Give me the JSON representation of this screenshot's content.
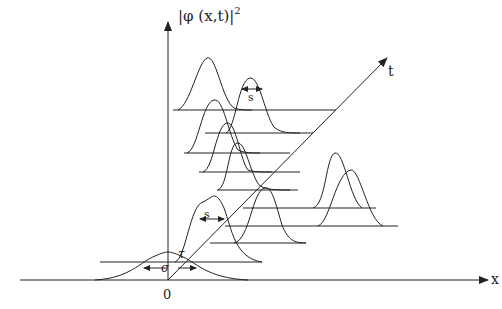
{
  "diagram": {
    "labels": {
      "y_axis": "|φ (x,t)|",
      "y_axis_exponent": "2",
      "t_axis": "t",
      "x_axis": "x",
      "origin": "0",
      "sigma": "σ",
      "tau": "τ",
      "s_lower": "s",
      "s_upper": "s"
    },
    "colors": {
      "stroke": "#222222",
      "background": "#ffffff"
    },
    "elements": [
      "vertical axis |φ(x,t)|²",
      "horizontal x axis",
      "diagonal t axis",
      "initial broad gaussian of width σ at origin",
      "series of narrower gaussians along t axis with width s",
      "horizontal baselines for each time slice"
    ]
  }
}
